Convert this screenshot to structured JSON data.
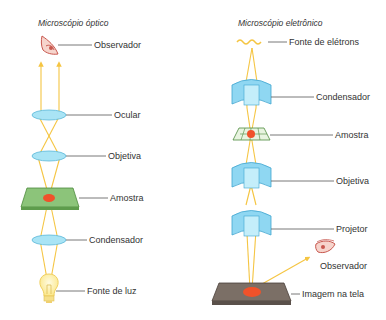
{
  "optical": {
    "title": "Microscópio óptico",
    "labels": {
      "observer": "Observador",
      "eyepiece": "Ocular",
      "objective": "Objetiva",
      "sample": "Amostra",
      "condenser": "Condensador",
      "light_source": "Fonte de luz"
    }
  },
  "electron": {
    "title": "Microscópio eletrônico",
    "labels": {
      "electron_source": "Fonte de elétrons",
      "condenser": "Condensador",
      "sample": "Amostra",
      "objective": "Objetiva",
      "projector": "Projetor",
      "observer": "Observador",
      "screen_image": "Imagem na tela"
    }
  },
  "colors": {
    "ray": "#f5c542",
    "lens": "#a9e4f5",
    "lens_stroke": "#5bb8d8",
    "sample_slide": "#8cc47a",
    "sample_dot": "#f0522a",
    "screen": "#7b6f66",
    "eye": "#c8574e"
  }
}
